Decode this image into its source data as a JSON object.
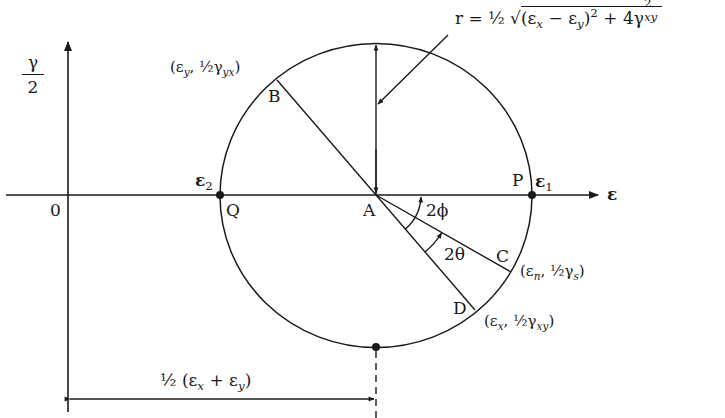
{
  "figure": {
    "type": "Mohr's circle for strain",
    "axes": {
      "horizontal_label": "ε",
      "vertical_label_numerator": "γ",
      "vertical_label_denominator": "2",
      "origin_label": "0"
    },
    "points": {
      "center": "A",
      "P": "P",
      "Q": "Q",
      "B": "B",
      "C": "C",
      "D": "D"
    },
    "principal_strains": {
      "e1": "ε",
      "e1_sub": "1",
      "e2": "ε",
      "e2_sub": "2"
    },
    "coordinates": {
      "B": {
        "open": "(ε",
        "sub1": "y",
        "mid": ", ½γ",
        "sub2": "yx",
        "close": ")"
      },
      "C": {
        "open": "(ε",
        "sub1": "n",
        "mid": ", ½γ",
        "sub2": "s",
        "close": ")"
      },
      "D": {
        "open": "(ε",
        "sub1": "x",
        "mid": ", ½γ",
        "sub2": "xy",
        "close": ")"
      }
    },
    "angles": {
      "phi": "2ϕ",
      "theta": "2θ"
    },
    "radius_formula": {
      "prefix": "r = ½ ",
      "term1": "(ε",
      "term1_sub": "x",
      "minus": " − ε",
      "term2_sub": "y",
      "close": ")",
      "power": "2",
      "plus": " + 4γ",
      "gamma_sup": "2",
      "gamma_sub": "xy"
    },
    "center_dimension": {
      "prefix": "½ (ε",
      "sub1": "x",
      "plus": " + ε",
      "sub2": "y",
      "close": ")"
    }
  }
}
